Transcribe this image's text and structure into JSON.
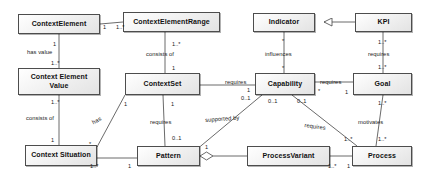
{
  "diagram": {
    "type": "uml-class-diagram",
    "canvas": {
      "width": 433,
      "height": 176
    },
    "style": {
      "node_fill": "#f0f0f0",
      "node_border": "#4d4d4d",
      "line": "#444444",
      "text": "#111111"
    },
    "nodes": [
      {
        "id": "context_element",
        "label": "ContextElement",
        "x": 18,
        "y": 14,
        "w": 82,
        "h": 20
      },
      {
        "id": "context_element_range",
        "label": "ContextElementRange",
        "x": 123,
        "y": 12,
        "w": 97,
        "h": 20
      },
      {
        "id": "context_element_value",
        "label": "Context Element\nValue",
        "x": 18,
        "y": 68,
        "w": 82,
        "h": 27
      },
      {
        "id": "context_set",
        "label": "ContextSet",
        "x": 125,
        "y": 73,
        "w": 75,
        "h": 22
      },
      {
        "id": "context_situation",
        "label": "Context Situation",
        "x": 25,
        "y": 145,
        "w": 72,
        "h": 21
      },
      {
        "id": "pattern",
        "label": "Pattern",
        "x": 137,
        "y": 146,
        "w": 63,
        "h": 20
      },
      {
        "id": "process_variant",
        "label": "ProcessVariant",
        "x": 247,
        "y": 146,
        "w": 83,
        "h": 20
      },
      {
        "id": "process",
        "label": "Process",
        "x": 352,
        "y": 146,
        "w": 60,
        "h": 20
      },
      {
        "id": "indicator",
        "label": "Indicator",
        "x": 253,
        "y": 13,
        "w": 62,
        "h": 19
      },
      {
        "id": "kpi",
        "label": "KPI",
        "x": 355,
        "y": 13,
        "w": 57,
        "h": 19
      },
      {
        "id": "capability",
        "label": "Capability",
        "x": 255,
        "y": 73,
        "w": 60,
        "h": 22
      },
      {
        "id": "goal",
        "label": "Goal",
        "x": 353,
        "y": 73,
        "w": 59,
        "h": 22
      }
    ],
    "edges": [
      {
        "id": "ce-cer",
        "from": "context_element",
        "to": "context_element_range",
        "label": "",
        "from_mult": "1",
        "to_mult": "1..*",
        "kind": "association"
      },
      {
        "id": "ce-cev",
        "from": "context_element",
        "to": "context_element_value",
        "label": "has value",
        "from_mult": "1",
        "to_mult": "1..*",
        "kind": "association"
      },
      {
        "id": "cer-cs",
        "from": "context_element_range",
        "to": "context_set",
        "label": "consists of",
        "from_mult": "1..*",
        "to_mult": "1",
        "kind": "association"
      },
      {
        "id": "cev-csit",
        "from": "context_element_value",
        "to": "context_situation",
        "label": "consists of",
        "from_mult": "1..*",
        "to_mult": "1",
        "kind": "association"
      },
      {
        "id": "cset-csit",
        "from": "context_set",
        "to": "context_situation",
        "label": "has",
        "from_mult": "1",
        "to_mult": "*",
        "kind": "association"
      },
      {
        "id": "cset-pat",
        "from": "context_set",
        "to": "pattern",
        "label": "requires",
        "from_mult": "1",
        "to_mult": "0..1",
        "kind": "association"
      },
      {
        "id": "csit-pat",
        "from": "context_situation",
        "to": "pattern",
        "label": "",
        "from_mult": "1..*",
        "to_mult": "1",
        "kind": "association"
      },
      {
        "id": "pat-pv",
        "from": "pattern",
        "to": "process_variant",
        "label": "",
        "from_mult": "",
        "to_mult": "",
        "kind": "aggregation"
      },
      {
        "id": "pv-proc",
        "from": "process_variant",
        "to": "process",
        "label": "",
        "from_mult": "1..*",
        "to_mult": "1",
        "kind": "association"
      },
      {
        "id": "cap-pat",
        "from": "capability",
        "to": "pattern",
        "label": "supported by",
        "from_mult": "0..1",
        "to_mult": "1",
        "kind": "association"
      },
      {
        "id": "cap-proc",
        "from": "capability",
        "to": "process",
        "label": "requires",
        "from_mult": "0..1",
        "to_mult": "1..*",
        "kind": "association"
      },
      {
        "id": "cset-cap",
        "from": "context_set",
        "to": "capability",
        "label": "requires",
        "from_mult": "1",
        "to_mult": "0..1",
        "kind": "association"
      },
      {
        "id": "ind-cap",
        "from": "indicator",
        "to": "capability",
        "label": "influences",
        "from_mult": "*",
        "to_mult": "*",
        "kind": "association"
      },
      {
        "id": "kpi-ind",
        "from": "kpi",
        "to": "indicator",
        "label": "",
        "from_mult": "",
        "to_mult": "",
        "kind": "generalization"
      },
      {
        "id": "kpi-goal",
        "from": "kpi",
        "to": "goal",
        "label": "requires",
        "from_mult": "1..*",
        "to_mult": "1..*",
        "kind": "association"
      },
      {
        "id": "cap-goal",
        "from": "capability",
        "to": "goal",
        "label": "requires",
        "from_mult": "*",
        "to_mult": "1",
        "kind": "association"
      },
      {
        "id": "goal-proc",
        "from": "goal",
        "to": "process",
        "label": "motivates",
        "from_mult": "1..*",
        "to_mult": "1..*",
        "kind": "association"
      }
    ],
    "multiplicity_labels": [
      {
        "id": "m01",
        "text": "1",
        "x": 103,
        "y": 24
      },
      {
        "id": "m02",
        "text": "1..*",
        "x": 116,
        "y": 24
      },
      {
        "id": "m03",
        "text": "1",
        "x": 53,
        "y": 41
      },
      {
        "id": "m04",
        "text": "1..*",
        "x": 51,
        "y": 60
      },
      {
        "id": "m05",
        "text": "1..*",
        "x": 172,
        "y": 41
      },
      {
        "id": "m06",
        "text": "1",
        "x": 172,
        "y": 65
      },
      {
        "id": "m07",
        "text": "1..*",
        "x": 51,
        "y": 99
      },
      {
        "id": "m08",
        "text": "1",
        "x": 51,
        "y": 137
      },
      {
        "id": "m09",
        "text": "1",
        "x": 124,
        "y": 101
      },
      {
        "id": "m10",
        "text": "*",
        "x": 89,
        "y": 141
      },
      {
        "id": "m11",
        "text": "1",
        "x": 171,
        "y": 101
      },
      {
        "id": "m12",
        "text": "0..1",
        "x": 172,
        "y": 135
      },
      {
        "id": "m13",
        "text": "1..*",
        "x": 90,
        "y": 163
      },
      {
        "id": "m14",
        "text": "1",
        "x": 128,
        "y": 163
      },
      {
        "id": "m15",
        "text": "1..*",
        "x": 328,
        "y": 163
      },
      {
        "id": "m16",
        "text": "1",
        "x": 347,
        "y": 163
      },
      {
        "id": "m17",
        "text": "1",
        "x": 205,
        "y": 144
      },
      {
        "id": "m18",
        "text": "1",
        "x": 247,
        "y": 87
      },
      {
        "id": "m19",
        "text": "0..1",
        "x": 241,
        "y": 95
      },
      {
        "id": "m20",
        "text": "0..1",
        "x": 268,
        "y": 98
      },
      {
        "id": "m21",
        "text": "0..1",
        "x": 297,
        "y": 98
      },
      {
        "id": "m22",
        "text": "*",
        "x": 318,
        "y": 88
      },
      {
        "id": "m23",
        "text": "1",
        "x": 345,
        "y": 89
      },
      {
        "id": "m24",
        "text": "*",
        "x": 282,
        "y": 38
      },
      {
        "id": "m25",
        "text": "*",
        "x": 282,
        "y": 65
      },
      {
        "id": "m26",
        "text": "1..*",
        "x": 378,
        "y": 39
      },
      {
        "id": "m27",
        "text": "1..*",
        "x": 378,
        "y": 64
      },
      {
        "id": "m28",
        "text": "1..*",
        "x": 378,
        "y": 100
      },
      {
        "id": "m29",
        "text": "1..*",
        "x": 378,
        "y": 136
      },
      {
        "id": "m30",
        "text": "1..*",
        "x": 344,
        "y": 136
      }
    ],
    "edge_labels": [
      {
        "id": "l1",
        "text": "has value",
        "x": 27,
        "y": 49
      },
      {
        "id": "l2",
        "text": "consists of",
        "x": 146,
        "y": 51
      },
      {
        "id": "l3",
        "text": "consists of",
        "x": 26,
        "y": 115
      },
      {
        "id": "l4",
        "text": "has",
        "x": 91,
        "y": 120
      },
      {
        "id": "l5",
        "text": "requires",
        "x": 150,
        "y": 119
      },
      {
        "id": "l6",
        "text": "supported by",
        "x": 205,
        "y": 117
      },
      {
        "id": "l7",
        "text": "requires",
        "x": 225,
        "y": 79
      },
      {
        "id": "l8",
        "text": "requires",
        "x": 320,
        "y": 79
      },
      {
        "id": "l9",
        "text": "influences",
        "x": 265,
        "y": 51
      },
      {
        "id": "l10",
        "text": "requires",
        "x": 368,
        "y": 51
      },
      {
        "id": "l11",
        "text": "motivates",
        "x": 358,
        "y": 119
      },
      {
        "id": "l12",
        "text": "requires",
        "x": 305,
        "y": 122
      }
    ]
  }
}
